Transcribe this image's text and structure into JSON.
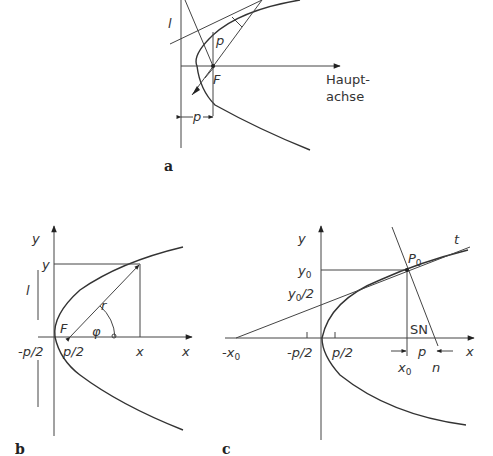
{
  "figures": [
    {
      "id": "a",
      "caption": "a",
      "labels": {
        "directrix": "l",
        "param": "p",
        "focus": "F",
        "axis_line1": "Haupt-",
        "axis_line2": "achse",
        "dim_p": "p"
      }
    },
    {
      "id": "b",
      "caption": "b",
      "labels": {
        "y_axis": "y",
        "x_axis": "x",
        "y_value": "y",
        "x_value": "x",
        "directrix": "l",
        "radius": "r",
        "angle": "φ",
        "focus": "F",
        "neg_half_p": "-p/2",
        "half_p": "p/2"
      }
    },
    {
      "id": "c",
      "caption": "c",
      "labels": {
        "y_axis": "y",
        "x_axis": "x",
        "tangent": "t",
        "point": "P",
        "point_sub": "0",
        "y0": "y",
        "y0_sub": "0",
        "y0_half": "y",
        "y0_half_sub": "0",
        "y0_half_suffix": "/2",
        "neg_x0": "-x",
        "neg_x0_sub": "0",
        "neg_half_p": "-p/2",
        "half_p": "p/2",
        "subnormal": "SN",
        "p": "p",
        "x0": "x",
        "x0_sub": "0",
        "n": "n"
      }
    }
  ]
}
